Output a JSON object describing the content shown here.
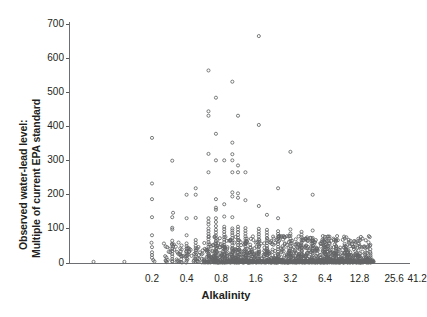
{
  "chart_data": {
    "type": "scatter",
    "title": "",
    "xlabel": "Alkalinity",
    "ylabel_line1": "Observed water-lead level:",
    "ylabel_line2": "Multiple of current EPA standard",
    "x_scale": "log2",
    "x_ticks": [
      0.2,
      0.4,
      0.8,
      1.6,
      3.2,
      6.4,
      12.8,
      25.6,
      41.2
    ],
    "x_tick_labels": [
      "0.2",
      "0.4",
      "0.8",
      "1.6",
      "3.2",
      "6.4",
      "12.8",
      "25.6",
      "41.2"
    ],
    "y_ticks": [
      0,
      100,
      200,
      300,
      400,
      500,
      600,
      700
    ],
    "y_tick_labels": [
      "0",
      "100",
      "200",
      "300",
      "400",
      "500",
      "600",
      "700"
    ],
    "ylim": [
      -20,
      730
    ],
    "xlim": [
      0.055,
      45.0
    ],
    "grid": false,
    "legend": false,
    "marker": "open-circle",
    "marker_color": "#636466",
    "points": [
      [
        0.062,
        2
      ],
      [
        0.115,
        2
      ],
      [
        0.2,
        366
      ],
      [
        0.2,
        232
      ],
      [
        0.2,
        186
      ],
      [
        0.2,
        133
      ],
      [
        0.2,
        80
      ],
      [
        0.2,
        45
      ],
      [
        0.2,
        30
      ],
      [
        0.2,
        22
      ],
      [
        0.2,
        14
      ],
      [
        0.205,
        7
      ],
      [
        0.21,
        3
      ],
      [
        0.198,
        58
      ],
      [
        0.3,
        299
      ],
      [
        0.305,
        146
      ],
      [
        0.3,
        133
      ],
      [
        0.3,
        102
      ],
      [
        0.3,
        97
      ],
      [
        0.3,
        64
      ],
      [
        0.3,
        52
      ],
      [
        0.3,
        40
      ],
      [
        0.3,
        33
      ],
      [
        0.3,
        25
      ],
      [
        0.3,
        18
      ],
      [
        0.3,
        10
      ],
      [
        0.3,
        4
      ],
      [
        0.4,
        199
      ],
      [
        0.4,
        130
      ],
      [
        0.4,
        80
      ],
      [
        0.4,
        56
      ],
      [
        0.4,
        48
      ],
      [
        0.4,
        41
      ],
      [
        0.4,
        33
      ],
      [
        0.4,
        27
      ],
      [
        0.4,
        19
      ],
      [
        0.4,
        12
      ],
      [
        0.4,
        5
      ],
      [
        0.48,
        218
      ],
      [
        0.48,
        199
      ],
      [
        0.48,
        131
      ],
      [
        0.48,
        66
      ],
      [
        0.48,
        58
      ],
      [
        0.48,
        49
      ],
      [
        0.48,
        42
      ],
      [
        0.48,
        36
      ],
      [
        0.48,
        29
      ],
      [
        0.48,
        23
      ],
      [
        0.48,
        17
      ],
      [
        0.48,
        9
      ],
      [
        0.48,
        3
      ],
      [
        0.62,
        564
      ],
      [
        0.62,
        444
      ],
      [
        0.62,
        431
      ],
      [
        0.62,
        319
      ],
      [
        0.62,
        265
      ],
      [
        0.62,
        130
      ],
      [
        0.62,
        120
      ],
      [
        0.62,
        112
      ],
      [
        0.62,
        100
      ],
      [
        0.62,
        92
      ],
      [
        0.62,
        84
      ],
      [
        0.62,
        75
      ],
      [
        0.62,
        68
      ],
      [
        0.62,
        60
      ],
      [
        0.62,
        53
      ],
      [
        0.62,
        46
      ],
      [
        0.62,
        39
      ],
      [
        0.62,
        32
      ],
      [
        0.62,
        26
      ],
      [
        0.62,
        20
      ],
      [
        0.62,
        14
      ],
      [
        0.62,
        8
      ],
      [
        0.62,
        3
      ],
      [
        0.72,
        484
      ],
      [
        0.72,
        378
      ],
      [
        0.72,
        300
      ],
      [
        0.72,
        186
      ],
      [
        0.72,
        161
      ],
      [
        0.72,
        155
      ],
      [
        0.72,
        130
      ],
      [
        0.72,
        119
      ],
      [
        0.72,
        107
      ],
      [
        0.72,
        96
      ],
      [
        0.72,
        88
      ],
      [
        0.72,
        79
      ],
      [
        0.72,
        71
      ],
      [
        0.72,
        63
      ],
      [
        0.72,
        55
      ],
      [
        0.72,
        47
      ],
      [
        0.72,
        40
      ],
      [
        0.72,
        34
      ],
      [
        0.72,
        28
      ],
      [
        0.72,
        21
      ],
      [
        0.72,
        15
      ],
      [
        0.72,
        9
      ],
      [
        0.72,
        4
      ],
      [
        0.85,
        300
      ],
      [
        0.85,
        171
      ],
      [
        0.85,
        135
      ],
      [
        0.85,
        105
      ],
      [
        0.85,
        98
      ],
      [
        0.85,
        90
      ],
      [
        0.85,
        82
      ],
      [
        0.85,
        74
      ],
      [
        0.85,
        67
      ],
      [
        0.85,
        60
      ],
      [
        0.85,
        52
      ],
      [
        0.85,
        45
      ],
      [
        0.85,
        38
      ],
      [
        0.85,
        31
      ],
      [
        0.85,
        25
      ],
      [
        0.85,
        18
      ],
      [
        0.85,
        12
      ],
      [
        0.85,
        6
      ],
      [
        0.85,
        2
      ],
      [
        1.0,
        531
      ],
      [
        1.0,
        352
      ],
      [
        1.0,
        318
      ],
      [
        1.0,
        300
      ],
      [
        1.0,
        265
      ],
      [
        1.0,
        206
      ],
      [
        1.0,
        194
      ],
      [
        1.0,
        133
      ],
      [
        1.0,
        100
      ],
      [
        1.0,
        94
      ],
      [
        1.0,
        87
      ],
      [
        1.0,
        80
      ],
      [
        1.0,
        72
      ],
      [
        1.0,
        65
      ],
      [
        1.0,
        58
      ],
      [
        1.0,
        50
      ],
      [
        1.0,
        43
      ],
      [
        1.0,
        36
      ],
      [
        1.0,
        30
      ],
      [
        1.0,
        24
      ],
      [
        1.0,
        17
      ],
      [
        1.0,
        11
      ],
      [
        1.0,
        5
      ],
      [
        1.0,
        1
      ],
      [
        1.12,
        431
      ],
      [
        1.12,
        285
      ],
      [
        1.12,
        265
      ],
      [
        1.12,
        203
      ],
      [
        1.12,
        190
      ],
      [
        1.12,
        105
      ],
      [
        1.12,
        97
      ],
      [
        1.12,
        89
      ],
      [
        1.12,
        81
      ],
      [
        1.12,
        73
      ],
      [
        1.12,
        66
      ],
      [
        1.12,
        59
      ],
      [
        1.12,
        51
      ],
      [
        1.12,
        44
      ],
      [
        1.12,
        37
      ],
      [
        1.12,
        30
      ],
      [
        1.12,
        23
      ],
      [
        1.12,
        16
      ],
      [
        1.12,
        10
      ],
      [
        1.12,
        4
      ],
      [
        1.3,
        265
      ],
      [
        1.3,
        183
      ],
      [
        1.3,
        101
      ],
      [
        1.3,
        93
      ],
      [
        1.3,
        85
      ],
      [
        1.3,
        77
      ],
      [
        1.3,
        70
      ],
      [
        1.3,
        62
      ],
      [
        1.3,
        54
      ],
      [
        1.3,
        47
      ],
      [
        1.3,
        39
      ],
      [
        1.3,
        32
      ],
      [
        1.3,
        26
      ],
      [
        1.3,
        19
      ],
      [
        1.3,
        13
      ],
      [
        1.3,
        7
      ],
      [
        1.3,
        2
      ],
      [
        1.7,
        665
      ],
      [
        1.7,
        404
      ],
      [
        1.7,
        166
      ],
      [
        1.7,
        99
      ],
      [
        1.7,
        91
      ],
      [
        1.7,
        83
      ],
      [
        1.7,
        76
      ],
      [
        1.7,
        68
      ],
      [
        1.7,
        61
      ],
      [
        1.7,
        53
      ],
      [
        1.7,
        46
      ],
      [
        1.7,
        38
      ],
      [
        1.7,
        31
      ],
      [
        1.7,
        24
      ],
      [
        1.7,
        18
      ],
      [
        1.7,
        11
      ],
      [
        1.7,
        5
      ],
      [
        2.0,
        140
      ],
      [
        2.0,
        96
      ],
      [
        2.0,
        88
      ],
      [
        2.0,
        80
      ],
      [
        2.0,
        72
      ],
      [
        2.0,
        64
      ],
      [
        2.0,
        57
      ],
      [
        2.0,
        49
      ],
      [
        2.0,
        42
      ],
      [
        2.0,
        35
      ],
      [
        2.0,
        28
      ],
      [
        2.0,
        21
      ],
      [
        2.0,
        15
      ],
      [
        2.0,
        8
      ],
      [
        2.0,
        3
      ],
      [
        2.5,
        218
      ],
      [
        2.5,
        130
      ],
      [
        2.5,
        92
      ],
      [
        2.5,
        84
      ],
      [
        2.5,
        76
      ],
      [
        2.5,
        69
      ],
      [
        2.5,
        61
      ],
      [
        2.5,
        54
      ],
      [
        2.5,
        46
      ],
      [
        2.5,
        39
      ],
      [
        2.5,
        32
      ],
      [
        2.5,
        25
      ],
      [
        2.5,
        18
      ],
      [
        2.5,
        12
      ],
      [
        2.5,
        6
      ],
      [
        2.5,
        1
      ],
      [
        3.2,
        325
      ],
      [
        3.2,
        97
      ],
      [
        3.2,
        85
      ],
      [
        3.2,
        78
      ],
      [
        3.2,
        70
      ],
      [
        3.2,
        63
      ],
      [
        3.2,
        55
      ],
      [
        3.2,
        48
      ],
      [
        3.2,
        41
      ],
      [
        3.2,
        34
      ],
      [
        3.2,
        27
      ],
      [
        3.2,
        20
      ],
      [
        3.2,
        14
      ],
      [
        3.2,
        7
      ],
      [
        3.2,
        2
      ],
      [
        4.0,
        90
      ],
      [
        4.0,
        82
      ],
      [
        4.0,
        74
      ],
      [
        4.0,
        66
      ],
      [
        4.0,
        59
      ],
      [
        4.0,
        51
      ],
      [
        4.0,
        44
      ],
      [
        4.0,
        37
      ],
      [
        4.0,
        30
      ],
      [
        4.0,
        23
      ],
      [
        4.0,
        16
      ],
      [
        4.0,
        10
      ],
      [
        4.0,
        4
      ],
      [
        5.0,
        199
      ],
      [
        5.0,
        94
      ],
      [
        5.0,
        72
      ],
      [
        5.0,
        64
      ],
      [
        5.0,
        57
      ],
      [
        5.0,
        49
      ],
      [
        5.0,
        42
      ],
      [
        5.0,
        35
      ],
      [
        5.0,
        28
      ],
      [
        5.0,
        21
      ],
      [
        5.0,
        14
      ],
      [
        5.0,
        8
      ],
      [
        5.0,
        3
      ],
      [
        6.4,
        68
      ],
      [
        6.4,
        60
      ],
      [
        6.4,
        52
      ],
      [
        6.4,
        45
      ],
      [
        6.4,
        38
      ],
      [
        6.4,
        31
      ],
      [
        6.4,
        24
      ],
      [
        6.4,
        17
      ],
      [
        6.4,
        11
      ],
      [
        6.4,
        5
      ],
      [
        8.0,
        66
      ],
      [
        8.0,
        48
      ],
      [
        8.0,
        40
      ],
      [
        8.0,
        33
      ],
      [
        8.0,
        26
      ],
      [
        8.0,
        19
      ],
      [
        8.0,
        13
      ],
      [
        8.0,
        7
      ],
      [
        8.0,
        2
      ],
      [
        10.0,
        30
      ],
      [
        10.0,
        22
      ],
      [
        10.0,
        15
      ],
      [
        10.0,
        9
      ],
      [
        10.0,
        3
      ],
      [
        12.8,
        26
      ],
      [
        12.8,
        18
      ],
      [
        12.8,
        11
      ],
      [
        12.8,
        5
      ],
      [
        12.8,
        1
      ],
      [
        14.5,
        12
      ],
      [
        14.5,
        6
      ],
      [
        14.5,
        2
      ],
      [
        16.0,
        8
      ],
      [
        16.0,
        3
      ],
      [
        16.0,
        1
      ]
    ],
    "dense_band_note": "A dense band of points lies between alkalinity 0.8 and 16 at y values near 0-80."
  }
}
